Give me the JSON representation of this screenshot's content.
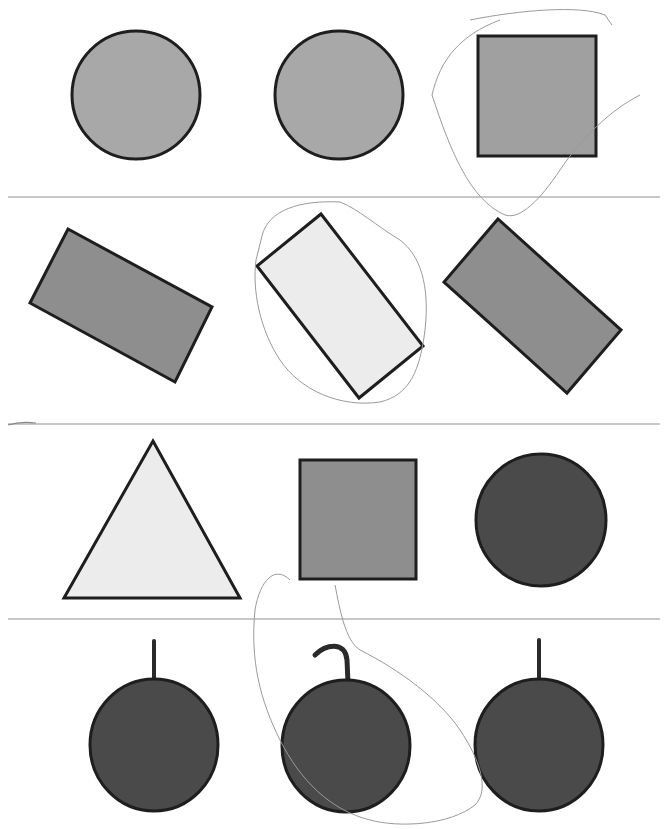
{
  "worksheet": {
    "title": "",
    "colors": {
      "background": "#ffffff",
      "outline": "#1e1e1e",
      "light_fill": "#ececec",
      "medium_fill": "#a8a8a8",
      "mid_dark_fill": "#8e8e8e",
      "dark_fill": "#4a4a4a",
      "divider": "#b4b4b4",
      "pencil": "#9a9a9a"
    },
    "rows": [
      {
        "index": 1,
        "shapes": [
          {
            "type": "circle",
            "fill": "medium",
            "circled": false
          },
          {
            "type": "circle",
            "fill": "medium",
            "circled": false
          },
          {
            "type": "square",
            "fill": "medium",
            "circled": true
          }
        ]
      },
      {
        "index": 2,
        "shapes": [
          {
            "type": "rotated-rectangle",
            "fill": "mid-dark",
            "circled": false
          },
          {
            "type": "rotated-rectangle",
            "fill": "light",
            "circled": true
          },
          {
            "type": "rotated-rectangle",
            "fill": "mid-dark",
            "circled": false
          }
        ]
      },
      {
        "index": 3,
        "shapes": [
          {
            "type": "triangle",
            "fill": "light",
            "circled": false
          },
          {
            "type": "rectangle",
            "fill": "mid-dark",
            "circled": false
          },
          {
            "type": "circle",
            "fill": "dark",
            "circled": false
          }
        ]
      },
      {
        "index": 4,
        "shapes": [
          {
            "type": "fruit-straight-stem",
            "fill": "dark",
            "circled": false
          },
          {
            "type": "fruit-curved-stem",
            "fill": "dark",
            "circled": true
          },
          {
            "type": "fruit-straight-stem",
            "fill": "dark",
            "circled": false
          }
        ]
      }
    ]
  }
}
